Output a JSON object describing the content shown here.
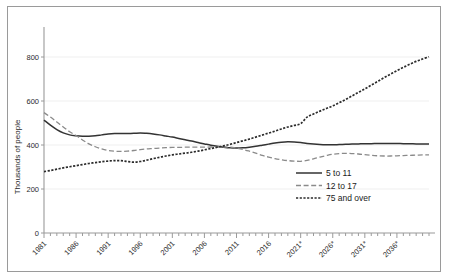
{
  "chart_data": {
    "type": "line",
    "title": "",
    "xlabel": "",
    "ylabel": "Thousands of people",
    "ylim": [
      0,
      900
    ],
    "xlim": [
      1981,
      2041
    ],
    "grid": true,
    "grid_orientation": "horizontal",
    "legend_position": "center-right",
    "y_ticks": [
      "0",
      "200",
      "400",
      "600",
      "800"
    ],
    "y_tick_values": [
      0,
      200,
      400,
      600,
      800
    ],
    "x_ticks": [
      "1981",
      "1986",
      "1991",
      "1996",
      "2001",
      "2006",
      "2011",
      "2016",
      "2021*",
      "2026*",
      "2031*",
      "2036*"
    ],
    "x_tick_values": [
      1981,
      1986,
      1991,
      1996,
      2001,
      2006,
      2011,
      2016,
      2021,
      2026,
      2031,
      2036
    ],
    "x": [
      1981,
      1982,
      1983,
      1984,
      1985,
      1986,
      1987,
      1988,
      1989,
      1990,
      1991,
      1992,
      1993,
      1994,
      1995,
      1996,
      1997,
      1998,
      1999,
      2000,
      2001,
      2002,
      2003,
      2004,
      2005,
      2006,
      2007,
      2008,
      2009,
      2010,
      2011,
      2012,
      2013,
      2014,
      2015,
      2016,
      2017,
      2018,
      2019,
      2020,
      2021,
      2022,
      2023,
      2024,
      2025,
      2026,
      2027,
      2028,
      2029,
      2030,
      2031,
      2032,
      2033,
      2034,
      2035,
      2036,
      2037,
      2038,
      2039,
      2040,
      2041
    ],
    "series": [
      {
        "name": "5 to 11",
        "style": "solid",
        "color": "#333333",
        "values": [
          513,
          490,
          470,
          455,
          446,
          442,
          440,
          440,
          442,
          446,
          450,
          452,
          452,
          452,
          453,
          455,
          453,
          450,
          446,
          441,
          436,
          430,
          424,
          418,
          411,
          405,
          399,
          394,
          390,
          387,
          386,
          387,
          390,
          394,
          399,
          404,
          409,
          413,
          415,
          414,
          411,
          407,
          404,
          402,
          401,
          401,
          402,
          403,
          404,
          405,
          406,
          406,
          407,
          407,
          407,
          407,
          406,
          406,
          405,
          405,
          405
        ]
      },
      {
        "name": "12 to 17",
        "style": "dashed",
        "color": "#8a8a8a",
        "values": [
          547,
          527,
          505,
          482,
          460,
          443,
          423,
          405,
          392,
          382,
          375,
          372,
          371,
          372,
          375,
          379,
          382,
          384,
          386,
          388,
          389,
          389,
          390,
          390,
          390,
          390,
          391,
          391,
          391,
          390,
          386,
          380,
          372,
          363,
          353,
          345,
          338,
          333,
          329,
          327,
          326,
          330,
          337,
          345,
          352,
          358,
          361,
          362,
          361,
          359,
          356,
          353,
          351,
          350,
          350,
          351,
          352,
          353,
          354,
          355,
          355
        ]
      },
      {
        "name": "75 and over",
        "style": "dotted",
        "color": "#2b2b2b",
        "values": [
          279,
          284,
          290,
          296,
          301,
          306,
          311,
          316,
          320,
          324,
          327,
          329,
          329,
          325,
          322,
          325,
          331,
          338,
          344,
          350,
          355,
          359,
          363,
          367,
          372,
          378,
          384,
          390,
          396,
          403,
          411,
          419,
          427,
          436,
          445,
          454,
          463,
          473,
          482,
          489,
          497,
          527,
          541,
          554,
          566,
          578,
          592,
          607,
          623,
          639,
          655,
          672,
          689,
          706,
          722,
          738,
          753,
          767,
          780,
          791,
          801
        ]
      }
    ]
  },
  "legend": {
    "items": [
      {
        "label": "5 to 11",
        "style": "solid"
      },
      {
        "label": "12 to 17",
        "style": "dashed"
      },
      {
        "label": "75 and over",
        "style": "dotted"
      }
    ]
  },
  "axes": {
    "y_axis_title": "Thousands of people"
  }
}
